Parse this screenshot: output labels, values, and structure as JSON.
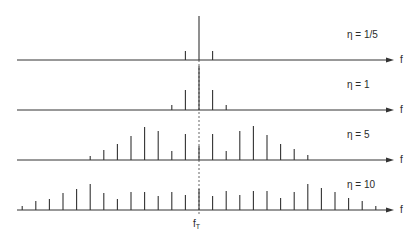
{
  "diagram": {
    "title": "",
    "center_label": "f",
    "center_label_sub": "T",
    "axis_label": "f",
    "colors": {
      "line": "#333333",
      "dash": "#555555",
      "background": "#ffffff"
    },
    "center_x": 199,
    "spacing": 13.6,
    "axis_start_x": 17,
    "axis_end_x": 394,
    "panels": [
      {
        "label": "η  = 1/5",
        "axis_y": 60,
        "label_x": 347,
        "label_y": 30,
        "spikes": [
          {
            "k": -1,
            "height": 9
          },
          {
            "k": 0,
            "height": 44
          },
          {
            "k": 1,
            "height": 9
          }
        ]
      },
      {
        "label": "η  = 1",
        "axis_y": 110,
        "label_x": 347,
        "label_y": 80,
        "spikes": [
          {
            "k": -2,
            "height": 5
          },
          {
            "k": -1,
            "height": 20
          },
          {
            "k": 0,
            "height": 44
          },
          {
            "k": 1,
            "height": 20
          },
          {
            "k": 2,
            "height": 5
          }
        ]
      },
      {
        "label": "η  = 5",
        "axis_y": 160,
        "label_x": 347,
        "label_y": 130,
        "spikes": [
          {
            "k": -8,
            "height": 4
          },
          {
            "k": -7,
            "height": 10
          },
          {
            "k": -6,
            "height": 16
          },
          {
            "k": -5,
            "height": 24
          },
          {
            "k": -4,
            "height": 33
          },
          {
            "k": -3,
            "height": 29
          },
          {
            "k": -2,
            "height": 9
          },
          {
            "k": -1,
            "height": 26
          },
          {
            "k": 0,
            "height": 14
          },
          {
            "k": 1,
            "height": 26
          },
          {
            "k": 2,
            "height": 9
          },
          {
            "k": 3,
            "height": 29
          },
          {
            "k": 4,
            "height": 34
          },
          {
            "k": 5,
            "height": 25
          },
          {
            "k": 6,
            "height": 16
          },
          {
            "k": 7,
            "height": 11
          },
          {
            "k": 8,
            "height": 5
          }
        ]
      },
      {
        "label": "η  = 10",
        "axis_y": 210,
        "label_x": 347,
        "label_y": 180,
        "spikes": [
          {
            "k": -13,
            "height": 4
          },
          {
            "k": -12,
            "height": 9
          },
          {
            "k": -11,
            "height": 11
          },
          {
            "k": -10,
            "height": 17
          },
          {
            "k": -9,
            "height": 21
          },
          {
            "k": -8,
            "height": 26
          },
          {
            "k": -7,
            "height": 17
          },
          {
            "k": -6,
            "height": 11
          },
          {
            "k": -5,
            "height": 18
          },
          {
            "k": -4,
            "height": 18
          },
          {
            "k": -3,
            "height": 14
          },
          {
            "k": -2,
            "height": 18
          },
          {
            "k": -1,
            "height": 15
          },
          {
            "k": 0,
            "height": 21
          },
          {
            "k": 1,
            "height": 14
          },
          {
            "k": 2,
            "height": 19
          },
          {
            "k": 3,
            "height": 15
          },
          {
            "k": 4,
            "height": 19
          },
          {
            "k": 5,
            "height": 19
          },
          {
            "k": 6,
            "height": 12
          },
          {
            "k": 7,
            "height": 18
          },
          {
            "k": 8,
            "height": 26
          },
          {
            "k": 9,
            "height": 22
          },
          {
            "k": 10,
            "height": 18
          },
          {
            "k": 11,
            "height": 12
          },
          {
            "k": 12,
            "height": 9
          },
          {
            "k": 13,
            "height": 4
          }
        ]
      }
    ]
  }
}
